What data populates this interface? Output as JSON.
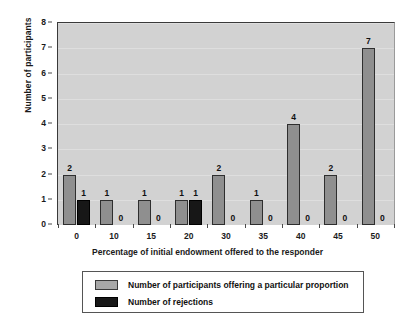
{
  "chart_data": {
    "type": "bar",
    "title": "",
    "xlabel": "Percentage of initial endowment offered to the responder",
    "ylabel": "Number of participants",
    "categories": [
      "0",
      "10",
      "15",
      "20",
      "30",
      "35",
      "40",
      "45",
      "50"
    ],
    "series": [
      {
        "name": "Number of participants offering a particular proportion",
        "color": "#8f8f8f",
        "values": [
          2,
          1,
          1,
          1,
          2,
          1,
          4,
          2,
          7
        ],
        "labels": [
          "2",
          "1",
          "1",
          "1",
          "2",
          "1",
          "4",
          "2",
          "7"
        ]
      },
      {
        "name": "Number of rejections",
        "color": "#171717",
        "values": [
          1,
          0,
          0,
          1,
          0,
          0,
          0,
          0,
          0
        ],
        "labels": [
          "1",
          "0",
          "0",
          "1",
          "0",
          "0",
          "0",
          "0",
          "0"
        ]
      }
    ],
    "ylim": [
      0,
      8
    ],
    "yticks": [
      0,
      1,
      2,
      3,
      4,
      5,
      6,
      7,
      8
    ],
    "ytick_labels": [
      "0",
      "1",
      "2",
      "3",
      "4",
      "5",
      "6",
      "7",
      "8"
    ],
    "grid": true,
    "legend_position": "bottom",
    "plot_background": "#d2d2d2"
  },
  "legend": {
    "items": [
      {
        "label": "Number of participants offering a particular proportion",
        "swatch": "gray"
      },
      {
        "label": "Number of rejections",
        "swatch": "black"
      }
    ]
  }
}
